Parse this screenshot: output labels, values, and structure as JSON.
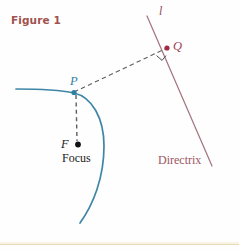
{
  "figure": {
    "caption": "Figure 1",
    "caption_color": "#a0524e",
    "background_color": "#fefefe",
    "width": 239,
    "height": 251
  },
  "labels": {
    "line_l": "l",
    "point_q": "Q",
    "point_p": "P",
    "point_f": "F",
    "focus": "Focus",
    "directrix": "Directrix"
  },
  "colors": {
    "parabola": "#3f86a6",
    "directrix_line": "#a6757f",
    "dashed": "#5d5d63",
    "focus_dot": "#111111",
    "q_dot": "#a32b45",
    "p_dot": "#2f7f9e",
    "right_angle": "#4a4a55",
    "bottom_rule": "#d9c27a"
  },
  "geometry": {
    "point_p": {
      "x": 74,
      "y": 92
    },
    "point_q": {
      "x": 167,
      "y": 48
    },
    "point_f": {
      "x": 78,
      "y": 145
    },
    "directrix_start": {
      "x": 147,
      "y": 16
    },
    "directrix_end": {
      "x": 212,
      "y": 166
    },
    "parabola_start": {
      "x": 16,
      "y": 89
    },
    "parabola_vertex_region": {
      "x": 74,
      "y": 92
    },
    "parabola_end": {
      "x": 80,
      "y": 223
    },
    "dashed_pq": {
      "x1": 74,
      "y1": 92,
      "x2": 167,
      "y2": 48
    },
    "dashed_pf": {
      "x1": 76,
      "y1": 95,
      "x2": 77,
      "y2": 141
    },
    "right_angle_marker": {
      "x": 161,
      "y": 56,
      "size": 8
    },
    "bottom_rule_y": 244
  }
}
